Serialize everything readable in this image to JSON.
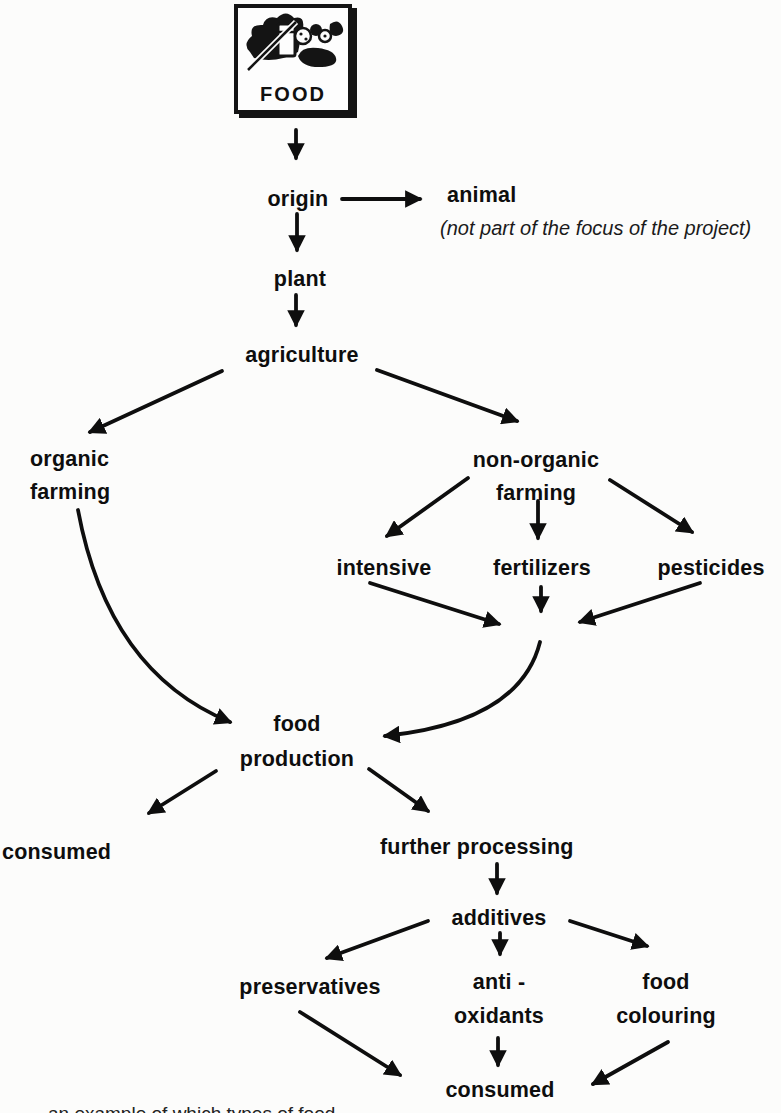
{
  "colors": {
    "ink": "#101010",
    "paper": "#fcfcfb"
  },
  "figure": {
    "food_box": {
      "label": "FOOD",
      "clipart_icon": "groceries-clipart-icon"
    },
    "nodes": {
      "origin": {
        "label": "origin"
      },
      "animal": {
        "label": "animal",
        "note": "(not part of the focus of the project)"
      },
      "plant": {
        "label": "plant"
      },
      "agriculture": {
        "label": "agriculture"
      },
      "organic_farming": {
        "line1": "organic",
        "line2": "farming"
      },
      "non_organic_farming": {
        "line1": "non-organic",
        "line2": "farming"
      },
      "intensive": {
        "label": "intensive"
      },
      "fertilizers": {
        "label": "fertilizers"
      },
      "pesticides": {
        "label": "pesticides"
      },
      "food_production": {
        "line1": "food",
        "line2": "production"
      },
      "consumed": {
        "label": "consumed"
      },
      "further_processing": {
        "label": "further processing"
      },
      "additives": {
        "label": "additives"
      },
      "preservatives": {
        "label": "preservatives"
      },
      "anti_oxidants": {
        "line1": "anti -",
        "line2": "oxidants"
      },
      "food_colouring": {
        "line1": "food",
        "line2": "colouring"
      },
      "consumed_final": {
        "label": "consumed"
      }
    },
    "edges": [
      {
        "from": "food",
        "to": "origin"
      },
      {
        "from": "origin",
        "to": "animal"
      },
      {
        "from": "origin",
        "to": "plant"
      },
      {
        "from": "plant",
        "to": "agriculture"
      },
      {
        "from": "agriculture",
        "to": "organic_farming"
      },
      {
        "from": "agriculture",
        "to": "non_organic_farming"
      },
      {
        "from": "non_organic_farming",
        "to": "intensive"
      },
      {
        "from": "non_organic_farming",
        "to": "fertilizers"
      },
      {
        "from": "non_organic_farming",
        "to": "pesticides"
      },
      {
        "from": "intensive",
        "to": "food_production"
      },
      {
        "from": "fertilizers",
        "to": "food_production"
      },
      {
        "from": "pesticides",
        "to": "food_production"
      },
      {
        "from": "organic_farming",
        "to": "food_production"
      },
      {
        "from": "food_production",
        "to": "consumed"
      },
      {
        "from": "food_production",
        "to": "further_processing"
      },
      {
        "from": "further_processing",
        "to": "additives"
      },
      {
        "from": "additives",
        "to": "preservatives"
      },
      {
        "from": "additives",
        "to": "anti_oxidants"
      },
      {
        "from": "additives",
        "to": "food_colouring"
      },
      {
        "from": "preservatives",
        "to": "consumed_final"
      },
      {
        "from": "anti_oxidants",
        "to": "consumed_final"
      },
      {
        "from": "food_colouring",
        "to": "consumed_final"
      }
    ],
    "caption_fragment": "an example of which types of food"
  }
}
